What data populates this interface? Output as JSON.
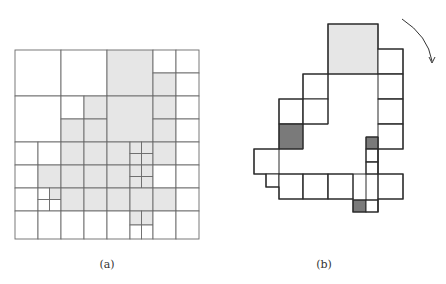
{
  "colors": {
    "stroke_a": "#6a6a6a",
    "stroke_b": "#2a2a2a",
    "light_fill": "#e6e6e6",
    "dark_fill": "#7a7a7a",
    "white": "#ffffff"
  },
  "figure_a": {
    "caption": "(a)",
    "caption_pos": [
      107,
      266
    ],
    "cells": [
      {
        "x": 15,
        "y": 50,
        "w": 46,
        "h": 46,
        "fill": "white"
      },
      {
        "x": 61,
        "y": 50,
        "w": 46,
        "h": 46,
        "fill": "white"
      },
      {
        "x": 107,
        "y": 50,
        "w": 46,
        "h": 46,
        "fill": "light"
      },
      {
        "x": 153,
        "y": 50,
        "w": 23,
        "h": 23,
        "fill": "white"
      },
      {
        "x": 176,
        "y": 50,
        "w": 23,
        "h": 23,
        "fill": "white"
      },
      {
        "x": 153,
        "y": 73,
        "w": 23,
        "h": 23,
        "fill": "light"
      },
      {
        "x": 176,
        "y": 73,
        "w": 23,
        "h": 23,
        "fill": "white"
      },
      {
        "x": 15,
        "y": 96,
        "w": 46,
        "h": 46,
        "fill": "white"
      },
      {
        "x": 61,
        "y": 96,
        "w": 23,
        "h": 23,
        "fill": "white"
      },
      {
        "x": 84,
        "y": 96,
        "w": 23,
        "h": 23,
        "fill": "light"
      },
      {
        "x": 61,
        "y": 119,
        "w": 23,
        "h": 23,
        "fill": "light"
      },
      {
        "x": 84,
        "y": 119,
        "w": 23,
        "h": 23,
        "fill": "light"
      },
      {
        "x": 107,
        "y": 96,
        "w": 46,
        "h": 46,
        "fill": "light"
      },
      {
        "x": 153,
        "y": 96,
        "w": 23,
        "h": 23,
        "fill": "light"
      },
      {
        "x": 176,
        "y": 96,
        "w": 23,
        "h": 23,
        "fill": "white"
      },
      {
        "x": 153,
        "y": 119,
        "w": 23,
        "h": 23,
        "fill": "light"
      },
      {
        "x": 176,
        "y": 119,
        "w": 23,
        "h": 23,
        "fill": "white"
      },
      {
        "x": 15,
        "y": 142,
        "w": 23,
        "h": 23,
        "fill": "white"
      },
      {
        "x": 38,
        "y": 142,
        "w": 23,
        "h": 23,
        "fill": "white"
      },
      {
        "x": 61,
        "y": 142,
        "w": 23,
        "h": 23,
        "fill": "light"
      },
      {
        "x": 84,
        "y": 142,
        "w": 23,
        "h": 23,
        "fill": "light"
      },
      {
        "x": 107,
        "y": 142,
        "w": 23,
        "h": 23,
        "fill": "light"
      },
      {
        "x": 130,
        "y": 142,
        "w": 11.5,
        "h": 11.5,
        "fill": "light"
      },
      {
        "x": 141.5,
        "y": 142,
        "w": 11.5,
        "h": 11.5,
        "fill": "light"
      },
      {
        "x": 130,
        "y": 153.5,
        "w": 11.5,
        "h": 11.5,
        "fill": "light"
      },
      {
        "x": 141.5,
        "y": 153.5,
        "w": 11.5,
        "h": 11.5,
        "fill": "light"
      },
      {
        "x": 153,
        "y": 142,
        "w": 23,
        "h": 23,
        "fill": "light"
      },
      {
        "x": 176,
        "y": 142,
        "w": 23,
        "h": 23,
        "fill": "white"
      },
      {
        "x": 15,
        "y": 165,
        "w": 23,
        "h": 23,
        "fill": "white"
      },
      {
        "x": 38,
        "y": 165,
        "w": 23,
        "h": 23,
        "fill": "light"
      },
      {
        "x": 61,
        "y": 165,
        "w": 23,
        "h": 23,
        "fill": "light"
      },
      {
        "x": 84,
        "y": 165,
        "w": 23,
        "h": 23,
        "fill": "light"
      },
      {
        "x": 107,
        "y": 165,
        "w": 23,
        "h": 23,
        "fill": "light"
      },
      {
        "x": 130,
        "y": 165,
        "w": 11.5,
        "h": 11.5,
        "fill": "light"
      },
      {
        "x": 141.5,
        "y": 165,
        "w": 11.5,
        "h": 11.5,
        "fill": "light"
      },
      {
        "x": 130,
        "y": 176.5,
        "w": 11.5,
        "h": 11.5,
        "fill": "light"
      },
      {
        "x": 141.5,
        "y": 176.5,
        "w": 11.5,
        "h": 11.5,
        "fill": "light"
      },
      {
        "x": 153,
        "y": 165,
        "w": 23,
        "h": 23,
        "fill": "white"
      },
      {
        "x": 176,
        "y": 165,
        "w": 23,
        "h": 23,
        "fill": "white"
      },
      {
        "x": 15,
        "y": 188,
        "w": 23,
        "h": 23,
        "fill": "white"
      },
      {
        "x": 38,
        "y": 188,
        "w": 11.5,
        "h": 11.5,
        "fill": "white"
      },
      {
        "x": 49.5,
        "y": 188,
        "w": 11.5,
        "h": 11.5,
        "fill": "light"
      },
      {
        "x": 38,
        "y": 199.5,
        "w": 11.5,
        "h": 11.5,
        "fill": "white"
      },
      {
        "x": 49.5,
        "y": 199.5,
        "w": 11.5,
        "h": 11.5,
        "fill": "white"
      },
      {
        "x": 61,
        "y": 188,
        "w": 23,
        "h": 23,
        "fill": "light"
      },
      {
        "x": 84,
        "y": 188,
        "w": 23,
        "h": 23,
        "fill": "light"
      },
      {
        "x": 107,
        "y": 188,
        "w": 23,
        "h": 23,
        "fill": "light"
      },
      {
        "x": 130,
        "y": 188,
        "w": 23,
        "h": 23,
        "fill": "light"
      },
      {
        "x": 153,
        "y": 188,
        "w": 23,
        "h": 23,
        "fill": "light"
      },
      {
        "x": 176,
        "y": 188,
        "w": 23,
        "h": 23,
        "fill": "white"
      },
      {
        "x": 15,
        "y": 211,
        "w": 23,
        "h": 28,
        "fill": "white"
      },
      {
        "x": 38,
        "y": 211,
        "w": 23,
        "h": 28,
        "fill": "white"
      },
      {
        "x": 61,
        "y": 211,
        "w": 23,
        "h": 28,
        "fill": "white"
      },
      {
        "x": 84,
        "y": 211,
        "w": 23,
        "h": 28,
        "fill": "white"
      },
      {
        "x": 107,
        "y": 211,
        "w": 23,
        "h": 28,
        "fill": "white"
      },
      {
        "x": 130,
        "y": 211,
        "w": 11.5,
        "h": 14,
        "fill": "light"
      },
      {
        "x": 141.5,
        "y": 211,
        "w": 11.5,
        "h": 14,
        "fill": "light"
      },
      {
        "x": 130,
        "y": 225,
        "w": 11.5,
        "h": 14,
        "fill": "white"
      },
      {
        "x": 141.5,
        "y": 225,
        "w": 11.5,
        "h": 14,
        "fill": "white"
      },
      {
        "x": 153,
        "y": 211,
        "w": 23,
        "h": 28,
        "fill": "white"
      },
      {
        "x": 176,
        "y": 211,
        "w": 23,
        "h": 28,
        "fill": "white"
      }
    ]
  },
  "figure_b": {
    "caption": "(b)",
    "caption_pos": [
      324,
      266
    ],
    "cells": [
      {
        "x": 328,
        "y": 24,
        "w": 50,
        "h": 50,
        "fill": "light"
      },
      {
        "x": 378,
        "y": 49,
        "w": 25,
        "h": 25,
        "fill": "white"
      },
      {
        "x": 378,
        "y": 74,
        "w": 25,
        "h": 25,
        "fill": "white"
      },
      {
        "x": 378,
        "y": 99,
        "w": 25,
        "h": 25,
        "fill": "white"
      },
      {
        "x": 378,
        "y": 124,
        "w": 25,
        "h": 25,
        "fill": "white"
      },
      {
        "x": 303,
        "y": 74,
        "w": 25,
        "h": 25,
        "fill": "white"
      },
      {
        "x": 279,
        "y": 99,
        "w": 24,
        "h": 25,
        "fill": "white"
      },
      {
        "x": 303,
        "y": 99,
        "w": 25,
        "h": 25,
        "fill": "white"
      },
      {
        "x": 279,
        "y": 124,
        "w": 24,
        "h": 25,
        "fill": "dark"
      },
      {
        "x": 254,
        "y": 149,
        "w": 25,
        "h": 25,
        "fill": "white"
      },
      {
        "x": 266,
        "y": 174,
        "w": 13,
        "h": 13,
        "fill": "white"
      },
      {
        "x": 279,
        "y": 174,
        "w": 24,
        "h": 25,
        "fill": "white"
      },
      {
        "x": 303,
        "y": 174,
        "w": 25,
        "h": 25,
        "fill": "white"
      },
      {
        "x": 328,
        "y": 174,
        "w": 25,
        "h": 25,
        "fill": "white"
      },
      {
        "x": 366,
        "y": 137,
        "w": 12,
        "h": 12,
        "fill": "dark"
      },
      {
        "x": 366,
        "y": 149,
        "w": 12,
        "h": 13,
        "fill": "white"
      },
      {
        "x": 366,
        "y": 162,
        "w": 12,
        "h": 12,
        "fill": "white"
      },
      {
        "x": 378,
        "y": 174,
        "w": 25,
        "h": 25,
        "fill": "white"
      },
      {
        "x": 353,
        "y": 200,
        "w": 13,
        "h": 12,
        "fill": "dark"
      },
      {
        "x": 366,
        "y": 200,
        "w": 12,
        "h": 12,
        "fill": "white"
      }
    ],
    "outline": "M328,24 L378,24 L378,49 L403,49 L403,149 L378,149 L378,174 L403,174 L403,199 L378,199 L378,212 L353,212 L353,199 L279,199 L279,187 L266,187 L266,174 L254,174 L254,149 L279,149 L279,99 L303,99 L303,74 L328,74 Z",
    "interior_lines": [
      "M328,74 L378,74",
      "M279,124 L303,124 L303,149 L279,149",
      "M303,99 L303,124 L328,124 L328,74",
      "M366,137 L378,137 L378,212",
      "M366,137 L366,174 L378,174",
      "M353,174 L366,174 L366,200",
      "M353,174 L353,199",
      "M303,174 L303,199",
      "M328,174 L328,199",
      "M279,174 L353,174",
      "M378,74 L403,74",
      "M378,99 L403,99",
      "M378,124 L403,124",
      "M366,149 L378,149",
      "M366,162 L378,162",
      "M353,200 L378,200"
    ]
  },
  "arrow": {
    "label": "rotation-arrow",
    "path": "M402,19 Q428,36 432,61",
    "head": [
      432,
      63
    ]
  }
}
